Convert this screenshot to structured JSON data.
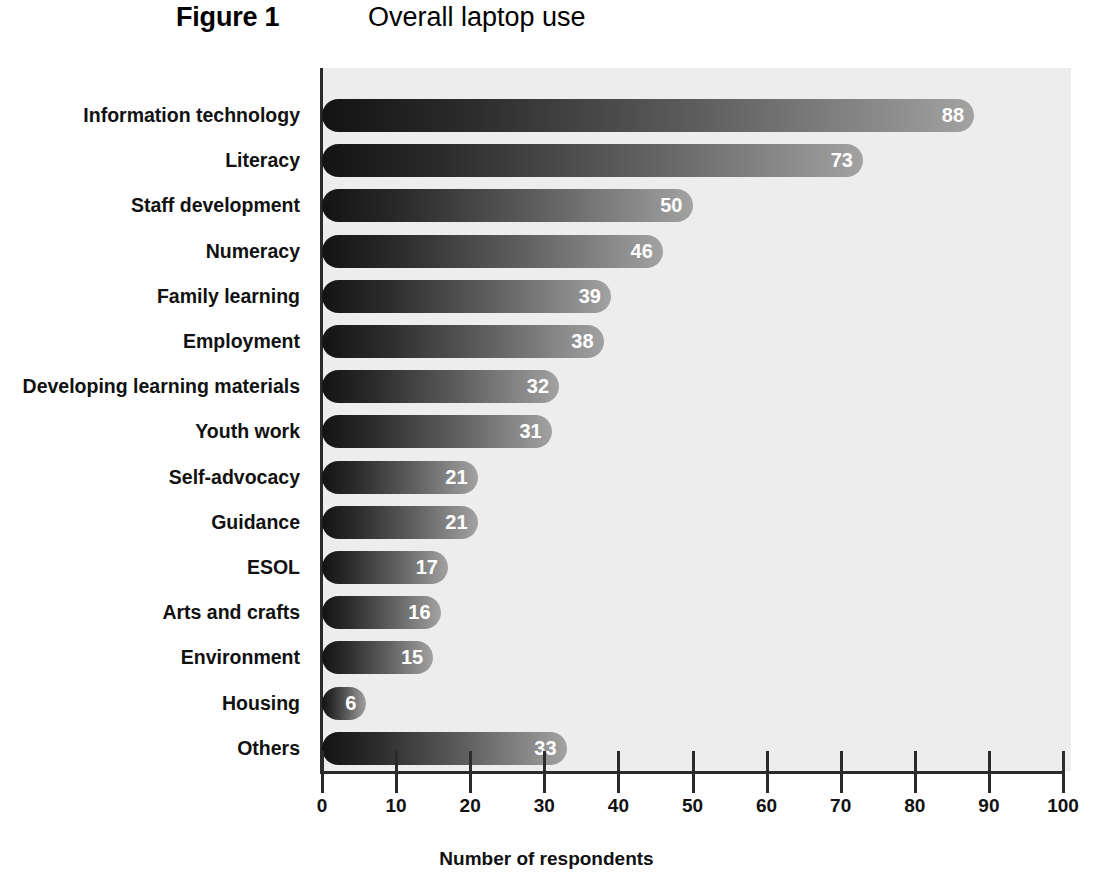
{
  "header": {
    "figure_number": "Figure 1",
    "title": "Overall laptop use"
  },
  "chart_data": {
    "type": "bar",
    "orientation": "horizontal",
    "title": "Overall laptop use",
    "figure_label": "Figure 1",
    "xlabel": "Number of respondents",
    "ylabel": "",
    "xlim": [
      0,
      100
    ],
    "xticks": [
      0,
      10,
      20,
      30,
      40,
      50,
      60,
      70,
      80,
      90,
      100
    ],
    "xtick_labels": [
      "0",
      "10",
      "20",
      "30",
      "40",
      "50",
      "60",
      "70",
      "80",
      "90",
      "100"
    ],
    "grid": false,
    "legend": false,
    "categories": [
      "Information technology",
      "Literacy",
      "Staff development",
      "Numeracy",
      "Family learning",
      "Employment",
      "Developing learning materials",
      "Youth work",
      "Self-advocacy",
      "Guidance",
      "ESOL",
      "Arts and crafts",
      "Environment",
      "Housing",
      "Others"
    ],
    "values": [
      88,
      73,
      50,
      46,
      39,
      38,
      32,
      31,
      21,
      21,
      17,
      16,
      15,
      6,
      33
    ],
    "value_labels": [
      "88",
      "73",
      "50",
      "46",
      "39",
      "38",
      "32",
      "31",
      "21",
      "21",
      "17",
      "16",
      "15",
      "6",
      "33"
    ],
    "colors": {
      "bar_gradient_start": "#131313",
      "bar_gradient_end": "#a2a2a2",
      "plot_background": "#ededed",
      "axis": "#2b2b2b",
      "value_label_text": "#ffffff",
      "text": "#111111",
      "page_background": "#ffffff"
    }
  }
}
